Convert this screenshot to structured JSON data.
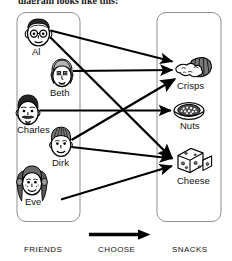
{
  "caption": "diagram looks like this:",
  "colors": {
    "ink": "#000000",
    "box_border": "#8a8a8a",
    "paper": "#ffffff",
    "hair_dark": "#262626",
    "hair_mid": "#6e6e6e",
    "skin": "#ffffff"
  },
  "left_group": {
    "name": "FRIENDS",
    "members": [
      {
        "id": "al",
        "label": "Al",
        "icon": "face-with-glasses-icon",
        "hair": "dark-short",
        "features": "round-glasses, large-ears"
      },
      {
        "id": "beth",
        "label": "Beth",
        "icon": "face-curly-hair-icon",
        "hair": "curly-light",
        "features": "earrings, wide-eyes"
      },
      {
        "id": "charles",
        "label": "Charles",
        "icon": "face-with-beard-icon",
        "hair": "dark-wavy",
        "features": "moustache, goatee"
      },
      {
        "id": "dirk",
        "label": "Dirk",
        "icon": "face-short-hair-icon",
        "hair": "striped-short",
        "features": "smiling"
      },
      {
        "id": "eve",
        "label": "Eve",
        "icon": "face-long-hair-icon",
        "hair": "long-pigtails",
        "features": "freckles, smiling"
      }
    ]
  },
  "right_group": {
    "name": "SNACKS",
    "items": [
      {
        "id": "crisps",
        "label": "Crisps",
        "icon": "crisps-bag-icon"
      },
      {
        "id": "nuts",
        "label": "Nuts",
        "icon": "bowl-of-nuts-icon"
      },
      {
        "id": "cheese",
        "label": "Cheese",
        "icon": "cheese-wedges-icon"
      }
    ]
  },
  "relation": {
    "label": "CHOOSE",
    "arrow_icon": "right-arrow-icon",
    "mappings": [
      {
        "from": "al",
        "to": "crisps"
      },
      {
        "from": "al",
        "to": "cheese"
      },
      {
        "from": "beth",
        "to": "crisps"
      },
      {
        "from": "charles",
        "to": "nuts"
      },
      {
        "from": "dirk",
        "to": "crisps"
      },
      {
        "from": "dirk",
        "to": "cheese"
      },
      {
        "from": "eve",
        "to": "cheese"
      }
    ]
  },
  "bottom_labels": {
    "left": "FRIENDS",
    "middle": "CHOOSE",
    "right": "SNACKS"
  }
}
